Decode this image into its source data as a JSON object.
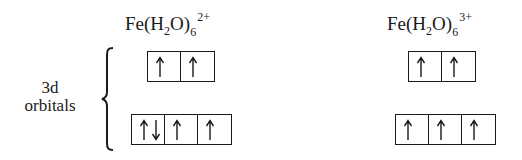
{
  "diagram": {
    "label": {
      "line1": "3d",
      "line2": "orbitals"
    },
    "complexes": [
      {
        "formula": {
          "base1": "Fe(H",
          "sub1": "2",
          "base2": "O)",
          "sub2": "6",
          "charge": "2+"
        },
        "upper_level": [
          [
            "up"
          ],
          [
            "up"
          ]
        ],
        "lower_level": [
          [
            "up",
            "down"
          ],
          [
            "up"
          ],
          [
            "up"
          ]
        ]
      },
      {
        "formula": {
          "base1": "Fe(H",
          "sub1": "2",
          "base2": "O)",
          "sub2": "6",
          "charge": "3+"
        },
        "upper_level": [
          [
            "up"
          ],
          [
            "up"
          ]
        ],
        "lower_level": [
          [
            "up"
          ],
          [
            "up"
          ],
          [
            "up"
          ]
        ]
      }
    ]
  }
}
